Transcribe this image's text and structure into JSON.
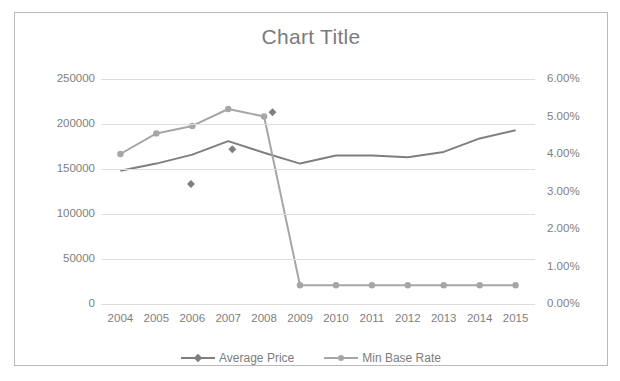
{
  "chart_data": {
    "type": "line",
    "title": "Chart Title",
    "xlabel": "",
    "ylabel": "",
    "categories": [
      "2004",
      "2005",
      "2006",
      "2007",
      "2008",
      "2009",
      "2010",
      "2011",
      "2012",
      "2013",
      "2014",
      "2015"
    ],
    "grid": true,
    "legend_position": "bottom",
    "axes": {
      "x": {
        "tick_labels": [
          "2004",
          "2005",
          "2006",
          "2007",
          "2008",
          "2009",
          "2010",
          "2011",
          "2012",
          "2013",
          "2014",
          "2015"
        ]
      },
      "y_left": {
        "label": "",
        "lim": [
          0,
          250000
        ],
        "ticks": [
          0,
          50000,
          100000,
          150000,
          200000,
          250000
        ],
        "tick_labels": [
          "0",
          "50000",
          "100000",
          "150000",
          "200000",
          "250000"
        ]
      },
      "y_right": {
        "label": "",
        "lim": [
          0,
          6
        ],
        "ticks": [
          0,
          1,
          2,
          3,
          4,
          5,
          6
        ],
        "tick_labels": [
          "0.00%",
          "1.00%",
          "2.00%",
          "3.00%",
          "4.00%",
          "5.00%",
          "6.00%"
        ]
      }
    },
    "series": [
      {
        "name": "Average Price",
        "axis": "y_left",
        "color": "#7f7f7f",
        "marker": "diamond",
        "values": [
          148000,
          156000,
          166000,
          181000,
          168000,
          156000,
          165000,
          165000,
          163000,
          169000,
          184000,
          193000
        ]
      },
      {
        "name": "Min Base Rate",
        "axis": "y_right",
        "color": "#a6a6a6",
        "marker": "circle",
        "values": [
          4.0,
          4.55,
          4.75,
          5.2,
          5.0,
          0.5,
          0.5,
          0.5,
          0.5,
          0.5,
          0.5,
          0.5
        ]
      }
    ]
  },
  "legend": {
    "items": [
      {
        "label": "Average Price"
      },
      {
        "label": "Min Base Rate"
      }
    ]
  }
}
